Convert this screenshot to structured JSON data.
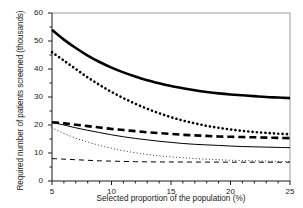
{
  "chart_data": {
    "type": "line",
    "title": "",
    "xlabel": "Selected proportion of the population (%)",
    "ylabel": "Required number of patients screened (thousands)",
    "xlim": [
      5,
      25
    ],
    "ylim": [
      0,
      60
    ],
    "xticks": [
      5,
      10,
      15,
      20,
      25
    ],
    "yticks": [
      0,
      10,
      20,
      30,
      40,
      50,
      60
    ],
    "xtick_labels": [
      "5",
      "10",
      "15",
      "20",
      "25"
    ],
    "ytick_labels": [
      "0",
      "10",
      "20",
      "30",
      "40",
      "50",
      "60"
    ],
    "grid": false,
    "legend": "none",
    "x": [
      5,
      6,
      7,
      8,
      9,
      10,
      11,
      12,
      13,
      14,
      15,
      16,
      17,
      18,
      19,
      20,
      21,
      22,
      23,
      24,
      25
    ],
    "series": [
      {
        "name": "thick-solid",
        "style": "solid",
        "width": 2.6,
        "color": "#000000",
        "values": [
          54.0,
          50.5,
          47.5,
          44.8,
          42.5,
          40.5,
          38.8,
          37.3,
          36.0,
          34.9,
          33.9,
          33.1,
          32.4,
          31.8,
          31.3,
          30.9,
          30.6,
          30.3,
          30.0,
          29.8,
          29.6
        ]
      },
      {
        "name": "thick-dotted",
        "style": "dotted",
        "width": 2.6,
        "color": "#000000",
        "values": [
          46.0,
          43.0,
          40.0,
          37.0,
          34.3,
          31.8,
          29.6,
          27.6,
          25.8,
          24.2,
          22.8,
          21.6,
          20.6,
          19.7,
          19.0,
          18.4,
          17.9,
          17.5,
          17.2,
          16.9,
          16.7
        ]
      },
      {
        "name": "thick-dashed",
        "style": "dashed",
        "width": 2.6,
        "color": "#000000",
        "values": [
          21.0,
          20.6,
          20.1,
          19.6,
          19.1,
          18.6,
          18.2,
          17.8,
          17.4,
          17.1,
          16.8,
          16.5,
          16.3,
          16.1,
          15.9,
          15.8,
          15.7,
          15.6,
          15.5,
          15.4,
          15.3
        ]
      },
      {
        "name": "thin-solid",
        "style": "solid",
        "width": 1.0,
        "color": "#000000",
        "values": [
          21.0,
          20.0,
          19.0,
          18.1,
          17.3,
          16.5,
          15.8,
          15.2,
          14.7,
          14.2,
          13.8,
          13.4,
          13.1,
          12.9,
          12.7,
          12.5,
          12.3,
          12.2,
          12.1,
          12.0,
          11.9
        ]
      },
      {
        "name": "thin-dotted",
        "style": "dotted",
        "width": 1.0,
        "color": "#000000",
        "values": [
          19.0,
          17.0,
          15.3,
          13.9,
          12.7,
          11.7,
          10.8,
          10.1,
          9.5,
          9.0,
          8.6,
          8.3,
          8.0,
          7.8,
          7.6,
          7.4,
          7.3,
          7.2,
          7.1,
          7.0,
          6.9
        ]
      },
      {
        "name": "thin-dashed",
        "style": "dashed",
        "width": 1.0,
        "color": "#000000",
        "values": [
          8.0,
          7.8,
          7.6,
          7.4,
          7.2,
          7.1,
          7.0,
          6.9,
          6.85,
          6.8,
          6.8,
          6.78,
          6.76,
          6.75,
          6.74,
          6.73,
          6.72,
          6.72,
          6.71,
          6.7,
          6.7
        ]
      }
    ]
  },
  "axes": {
    "frame_color": "#9a9a9a",
    "axis_color": "#1a1a1a"
  }
}
